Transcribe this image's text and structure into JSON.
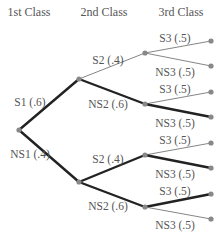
{
  "headers": [
    {
      "label": "1st Class",
      "x": 29,
      "y": 16
    },
    {
      "label": "2nd Class",
      "x": 104,
      "y": 16
    },
    {
      "label": "3rd Class",
      "x": 181,
      "y": 16
    }
  ],
  "colors": {
    "thin_line": "#777777",
    "thick_line": "#222222",
    "node": "#888888",
    "text": "#555555"
  },
  "nodes": {
    "root": {
      "x": 19,
      "y": 130
    },
    "s1": {
      "x": 79,
      "y": 79
    },
    "ns1": {
      "x": 79,
      "y": 182
    },
    "s1_s2": {
      "x": 145,
      "y": 53
    },
    "s1_ns2": {
      "x": 145,
      "y": 104
    },
    "ns1_s2": {
      "x": 145,
      "y": 155
    },
    "ns1_ns2": {
      "x": 145,
      "y": 207
    },
    "leaf1": {
      "x": 211,
      "y": 41
    },
    "leaf2": {
      "x": 211,
      "y": 66
    },
    "leaf3": {
      "x": 211,
      "y": 92
    },
    "leaf4": {
      "x": 211,
      "y": 117
    },
    "leaf5": {
      "x": 211,
      "y": 143
    },
    "leaf6": {
      "x": 211,
      "y": 168
    },
    "leaf7": {
      "x": 211,
      "y": 194
    },
    "leaf8": {
      "x": 211,
      "y": 219
    }
  },
  "edges": [
    {
      "from": "root",
      "to": "s1",
      "label": "S1 (.6)",
      "lx": 30,
      "ly": 106,
      "thick": true
    },
    {
      "from": "root",
      "to": "ns1",
      "label": "NS1 (.4)",
      "lx": 30,
      "ly": 158,
      "thick": true
    },
    {
      "from": "s1",
      "to": "s1_s2",
      "label": "S2 (.4)",
      "lx": 108,
      "ly": 64,
      "thick": false
    },
    {
      "from": "s1",
      "to": "s1_ns2",
      "label": "NS2 (.6)",
      "lx": 108,
      "ly": 108,
      "thick": true
    },
    {
      "from": "ns1",
      "to": "ns1_s2",
      "label": "S2 (.4)",
      "lx": 108,
      "ly": 163,
      "thick": true
    },
    {
      "from": "ns1",
      "to": "ns1_ns2",
      "label": "NS2 (.6)",
      "lx": 108,
      "ly": 210,
      "thick": true
    },
    {
      "from": "s1_s2",
      "to": "leaf1",
      "label": "S3 (.5)",
      "lx": 175,
      "ly": 42,
      "thick": false
    },
    {
      "from": "s1_s2",
      "to": "leaf2",
      "label": "NS3 (.5)",
      "lx": 175,
      "ly": 76,
      "thick": false
    },
    {
      "from": "s1_ns2",
      "to": "leaf3",
      "label": "S3 (.5)",
      "lx": 175,
      "ly": 93,
      "thick": false
    },
    {
      "from": "s1_ns2",
      "to": "leaf4",
      "label": "NS3 (.5)",
      "lx": 175,
      "ly": 127,
      "thick": true
    },
    {
      "from": "ns1_s2",
      "to": "leaf5",
      "label": "S3 (.5)",
      "lx": 175,
      "ly": 144,
      "thick": false
    },
    {
      "from": "ns1_s2",
      "to": "leaf6",
      "label": "NS3 (.5)",
      "lx": 175,
      "ly": 178,
      "thick": true
    },
    {
      "from": "ns1_ns2",
      "to": "leaf7",
      "label": "S3 (.5)",
      "lx": 175,
      "ly": 195,
      "thick": true
    },
    {
      "from": "ns1_ns2",
      "to": "leaf8",
      "label": "NS3 (.5)",
      "lx": 175,
      "ly": 229,
      "thick": false
    }
  ]
}
